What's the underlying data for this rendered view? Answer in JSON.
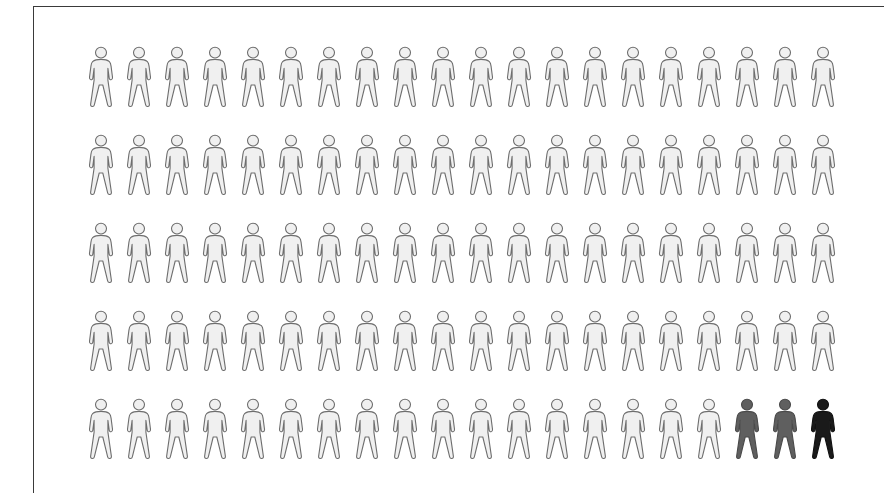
{
  "figure": {
    "type": "pictogram-chart",
    "background_color": "#ffffff",
    "frame": {
      "border_color": "#3a3a3a",
      "border_width_px": 1.5,
      "visible_edges": "top-and-left"
    }
  },
  "chart_data": {
    "type": "pictogram",
    "title": "",
    "subtitle": "",
    "xlabel": "",
    "ylabel": "",
    "total_icons": 100,
    "rows": 5,
    "columns": 20,
    "icon_shape": "person",
    "categories": [
      "Unhighlighted",
      "Mid-highlight",
      "Full-highlight"
    ],
    "values": [
      97,
      2,
      1
    ],
    "series": [
      {
        "name": "Unhighlighted",
        "count": 97,
        "color": "#f0f0f0",
        "outline": "#6e6e6e"
      },
      {
        "name": "Mid-highlight",
        "count": 2,
        "color": "#5f5f5f",
        "outline": "#4a4a4a"
      },
      {
        "name": "Full-highlight",
        "count": 1,
        "color": "#1a1a1a",
        "outline": "#111111"
      }
    ],
    "legend_position": "none",
    "grid": false,
    "annotations": [],
    "icon_states_by_row": [
      [
        "light",
        "light",
        "light",
        "light",
        "light",
        "light",
        "light",
        "light",
        "light",
        "light",
        "light",
        "light",
        "light",
        "light",
        "light",
        "light",
        "light",
        "light",
        "light",
        "light"
      ],
      [
        "light",
        "light",
        "light",
        "light",
        "light",
        "light",
        "light",
        "light",
        "light",
        "light",
        "light",
        "light",
        "light",
        "light",
        "light",
        "light",
        "light",
        "light",
        "light",
        "light"
      ],
      [
        "light",
        "light",
        "light",
        "light",
        "light",
        "light",
        "light",
        "light",
        "light",
        "light",
        "light",
        "light",
        "light",
        "light",
        "light",
        "light",
        "light",
        "light",
        "light",
        "light"
      ],
      [
        "light",
        "light",
        "light",
        "light",
        "light",
        "light",
        "light",
        "light",
        "light",
        "light",
        "light",
        "light",
        "light",
        "light",
        "light",
        "light",
        "light",
        "light",
        "light",
        "light"
      ],
      [
        "light",
        "light",
        "light",
        "light",
        "light",
        "light",
        "light",
        "light",
        "light",
        "light",
        "light",
        "light",
        "light",
        "light",
        "light",
        "light",
        "light",
        "gray",
        "gray",
        "black"
      ]
    ]
  },
  "palette": {
    "light_fill": "#f0f0f0",
    "light_outline": "#6e6e6e",
    "gray_fill": "#5f5f5f",
    "gray_outline": "#4a4a4a",
    "black_fill": "#1a1a1a",
    "black_outline": "#111111",
    "frame_border": "#3a3a3a",
    "background": "#ffffff"
  },
  "layout": {
    "row_tops_px": [
      44,
      132,
      220,
      308,
      396
    ],
    "grid_left_px": 88,
    "icon_width_px": 26,
    "icon_height_px": 64,
    "icon_gap_px": 12
  }
}
